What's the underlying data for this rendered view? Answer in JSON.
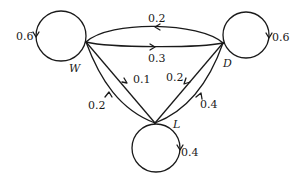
{
  "diagram": {
    "type": "markov-chain-state-diagram",
    "nodes": [
      {
        "id": "W",
        "label": "W",
        "self_loop": "0.6"
      },
      {
        "id": "D",
        "label": "D",
        "self_loop": "0.6"
      },
      {
        "id": "L",
        "label": "L",
        "self_loop": "0.4"
      }
    ],
    "edges": [
      {
        "from": "D",
        "to": "W",
        "label": "0.2"
      },
      {
        "from": "W",
        "to": "D",
        "label": "0.3"
      },
      {
        "from": "W",
        "to": "L",
        "label": "0.1"
      },
      {
        "from": "L",
        "to": "W",
        "label": "0.2"
      },
      {
        "from": "D",
        "to": "L",
        "label": "0.2"
      },
      {
        "from": "L",
        "to": "D",
        "label": "0.4"
      }
    ]
  },
  "labels": {
    "node_w": "W",
    "node_d": "D",
    "node_l": "L",
    "loop_w": "0.6",
    "loop_d": "0.6",
    "loop_l": "0.4",
    "d_to_w": "0.2",
    "w_to_d": "0.3",
    "w_to_l": "0.1",
    "l_to_w": "0.2",
    "d_to_l": "0.2",
    "l_to_d": "0.4"
  }
}
